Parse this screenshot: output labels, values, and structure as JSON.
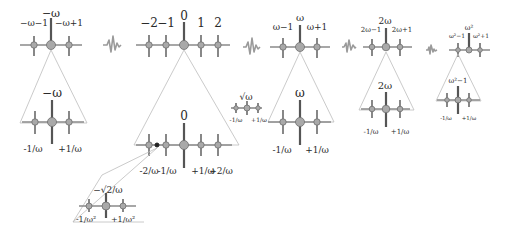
{
  "diagram": {
    "colors": {
      "axis": "#8a8a8a",
      "node": "#a9a9a9",
      "tick": "#555555",
      "cone": "#bdbdbd",
      "text": "#2a2a2a",
      "background": "#ffffff"
    },
    "panels": [
      {
        "id": "neg-omega",
        "top_labels": {
          "left": "−ω−1",
          "center": "−ω",
          "right": "−ω+1"
        },
        "zoom_center_label": "−ω",
        "zoom_labels": {
          "left": "-1/ω",
          "right": "+1/ω"
        }
      },
      {
        "id": "integers",
        "top_labels": [
          "−2",
          "−1",
          "0",
          "1",
          "2"
        ],
        "zoom_center_label": "0",
        "zoom_labels": [
          "-2/ω",
          "-1/ω",
          "+1/ω",
          "+2/ω"
        ],
        "sub_zoom": {
          "center_label": "−√2/ω",
          "labels": {
            "left": "-1/ω²",
            "right": "+1/ω²"
          }
        }
      },
      {
        "id": "sqrt-omega",
        "center_label": "√ω",
        "labels": {
          "left": "-1/ω",
          "right": "+1/ω"
        }
      },
      {
        "id": "omega",
        "top_labels": {
          "left": "ω−1",
          "center": "ω",
          "right": "ω+1"
        },
        "zoom_center_label": "ω",
        "zoom_labels": {
          "left": "-1/ω",
          "right": "+1/ω"
        }
      },
      {
        "id": "two-omega",
        "top_labels": {
          "left": "2ω−1",
          "center": "2ω",
          "right": "2ω+1"
        },
        "zoom_center_label": "2ω",
        "zoom_labels": {
          "left": "-1/ω",
          "right": "+1/ω"
        }
      },
      {
        "id": "omega-squared",
        "top_labels": {
          "left": "ω²−1",
          "center": "ω²",
          "right": "ω²+1"
        },
        "zoom_center_label": "ω²−1",
        "zoom_labels": {
          "left": "-1/ω",
          "right": "+1/ω"
        }
      }
    ],
    "separators": [
      "wave-gap-icon",
      "wave-gap-icon",
      "wave-gap-icon",
      "wave-gap-icon"
    ]
  }
}
